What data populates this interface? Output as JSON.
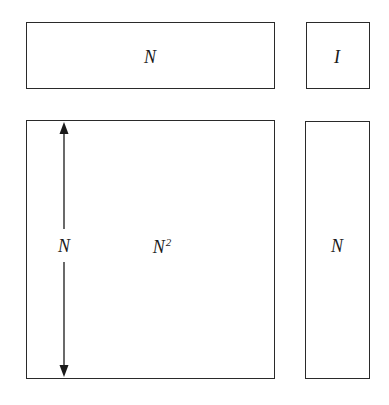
{
  "diagram": {
    "boxes": [
      {
        "id": "row-vector",
        "label": "N"
      },
      {
        "id": "scalar",
        "label": "I"
      },
      {
        "id": "matrix",
        "label": "N",
        "superscript": "2",
        "side_label": "N"
      },
      {
        "id": "column-vector",
        "label": "N"
      }
    ],
    "dimension_arrow": {
      "label": "N",
      "orientation": "vertical",
      "ends": "double-headed"
    },
    "colors": {
      "stroke": "#2a2a2a",
      "text": "#1a1a1a",
      "background": "#ffffff"
    }
  }
}
